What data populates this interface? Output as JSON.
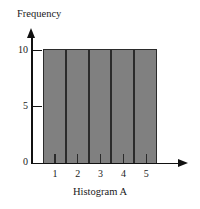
{
  "chart_data": {
    "type": "bar",
    "title": "",
    "xlabel": "Histogram A",
    "ylabel": "Frequency",
    "categories": [
      "1",
      "2",
      "3",
      "4",
      "5"
    ],
    "values": [
      10,
      10,
      10,
      10,
      10
    ],
    "ylim": [
      0,
      10
    ],
    "yticks": [
      0,
      5,
      10
    ],
    "ytick_labels": [
      "0",
      "5",
      "10"
    ],
    "xtick_labels": [
      "1",
      "2",
      "3",
      "4",
      "5"
    ],
    "grid": false,
    "legend": null,
    "bar_color": "#808080",
    "bar_edge_color": "#2b2b2b",
    "axis_color": "#111111",
    "background_color": "#ffffff"
  },
  "axes": {
    "y_title": "Frequency",
    "x_title": "Histogram A",
    "y_ticks": [
      {
        "label": "10",
        "value": 10
      },
      {
        "label": "5",
        "value": 5
      },
      {
        "label": "0",
        "value": 0
      }
    ],
    "x_ticks": [
      {
        "label": "1"
      },
      {
        "label": "2"
      },
      {
        "label": "3"
      },
      {
        "label": "4"
      },
      {
        "label": "5"
      }
    ]
  },
  "bars": [
    {
      "category": "1",
      "value": 10
    },
    {
      "category": "2",
      "value": 10
    },
    {
      "category": "3",
      "value": 10
    },
    {
      "category": "4",
      "value": 10
    },
    {
      "category": "5",
      "value": 10
    }
  ]
}
